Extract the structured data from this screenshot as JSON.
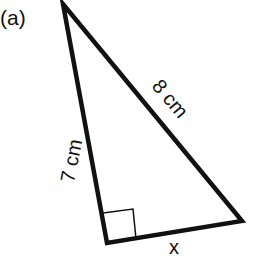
{
  "figure": {
    "label": "(a)",
    "shape": "right triangle",
    "sides": {
      "left": "7 cm",
      "hypotenuse": "8 cm",
      "bottom": "x"
    },
    "right_angle_marker": "square at bottom-left vertex",
    "colors": {
      "line": "#111111",
      "background": "#ffffff"
    }
  }
}
